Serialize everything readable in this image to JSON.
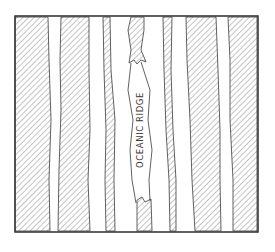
{
  "diagram": {
    "ridge_label": "OCEANIC RIDGE",
    "colors": {
      "ink": "#3a3a3a",
      "hatch": "#8a8a8a",
      "paper": "#ffffff"
    },
    "frame": {
      "x": 15,
      "y": 16,
      "w": 243,
      "h": 216
    },
    "stripes": [
      {
        "name": "stripe-left-1",
        "points": "15,17 48,17 49,60 51,120 49,180 50,231 15,231"
      },
      {
        "name": "stripe-left-2",
        "points": "61,17 89,17 89,70 90,130 88,180 90,231 58,231 59,170 61,110 60,60"
      },
      {
        "name": "stripe-left-3",
        "points": "103,17 110,17 111,70 115,120 114,180 115,231 106,231 105,180 106,130 104,70"
      },
      {
        "name": "stripe-ridge-top",
        "points": "131,17 144,17 144,30 141,50 146,62 141,60 137,64 134,60 129,63 131,50 128,30"
      },
      {
        "name": "stripe-ridge-bottom",
        "points": "137,200 142,197 145,202 151,199 152,231 137,231"
      },
      {
        "name": "stripe-right-1",
        "points": "163,17 172,17 171,70 173,130 176,180 176,231 170,231 169,180 166,130 164,70"
      },
      {
        "name": "stripe-right-2",
        "points": "186,17 216,17 218,70 220,130 220,180 221,231 195,231 192,180 190,120 187,60"
      },
      {
        "name": "stripe-right-3",
        "points": "228,17 257,17 257,231 233,231 233,180 230,120 230,60"
      }
    ],
    "ridge_outline": {
      "left": "131,63 128,90 133,120 130,150 132,180 136,203",
      "right": "141,62 150,90 148,120 152,150 149,180 150,201"
    }
  }
}
